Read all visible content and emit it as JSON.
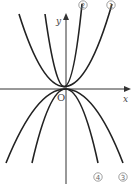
{
  "figure": {
    "type": "graph of parabolas through origin",
    "axes": {
      "x_label": "x",
      "y_label": "y",
      "origin_label": "O"
    },
    "curves": [
      {
        "id": "1",
        "label": "①",
        "direction": "opens up",
        "width": "wide"
      },
      {
        "id": "2",
        "label": "②",
        "direction": "opens up",
        "width": "narrow"
      },
      {
        "id": "3",
        "label": "③",
        "direction": "opens down",
        "width": "wide"
      },
      {
        "id": "4",
        "label": "④",
        "direction": "opens down",
        "width": "narrow"
      }
    ],
    "colors": {
      "curve": "#222222",
      "axis": "#333333",
      "label": "#666666"
    }
  }
}
